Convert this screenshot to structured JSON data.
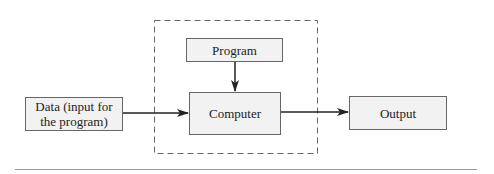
{
  "diagram": {
    "nodes": {
      "program": "Program",
      "computer": "Computer",
      "data": "Data (input for the program)",
      "output": "Output"
    },
    "edges": [
      {
        "from": "program",
        "to": "computer"
      },
      {
        "from": "data",
        "to": "computer"
      },
      {
        "from": "computer",
        "to": "output"
      }
    ],
    "colors": {
      "box_fill": "#f2f2f2",
      "stroke": "#222222",
      "dashed": "#666666"
    }
  }
}
